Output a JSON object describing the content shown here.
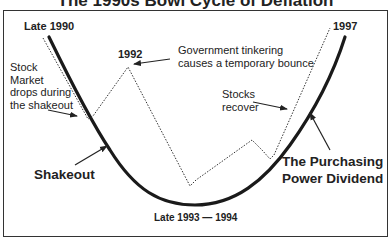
{
  "title": "The 1990s Bowl Cycle of Deflation",
  "labels": {
    "late_1990": "Late 1990",
    "y1992": "1992",
    "y1997": "1997",
    "bottom": "Late 1993 — 1994",
    "gov_line1": "Government tinkering",
    "gov_line2": "causes a temporary bounce",
    "stock_line1": "Stock",
    "stock_line2": "Market",
    "stock_line3": "drops during",
    "stock_line4": "the shakeout",
    "recover_line1": "Stocks",
    "recover_line2": "recover",
    "shakeout": "Shakeout",
    "dividend_line1": "The Purchasing",
    "dividend_line2": "Power Dividend"
  },
  "series": {
    "economy_curve": {
      "style": "solid-thick",
      "color": "#1a1a1a"
    },
    "stock_market": {
      "style": "dotted",
      "color": "#333333"
    }
  }
}
